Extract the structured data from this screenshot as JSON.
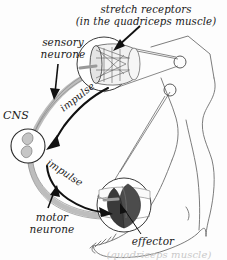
{
  "diagram": {
    "background_color": "#fdfdfd",
    "ink_color": "#1a1a1a",
    "neurone_fill": "#d8d8d8",
    "endplate_color": "#4a4a4a",
    "labels": {
      "stretch_receptors": "stretch receptors",
      "stretch_receptors_sub": "(in the quadriceps muscle)",
      "sensory_neurone": "sensory\nneurone",
      "sensory_neurone_line1": "sensory",
      "sensory_neurone_line2": "neurone",
      "cns": "CNS",
      "impulse_up": "impulse",
      "impulse_down": "impulse",
      "motor_neurone_line1": "motor",
      "motor_neurone_line2": "neurone",
      "effector": "effector",
      "effector_sub": "(quadriceps muscle)"
    },
    "parts": {
      "muscle_spindle": "muscle-spindle-detail",
      "motor_end_plate": "motor-end-plate-detail",
      "leg": "leg-illustration",
      "foot": "foot-illustration",
      "cns_circle": "cns-cell-bodies"
    }
  }
}
